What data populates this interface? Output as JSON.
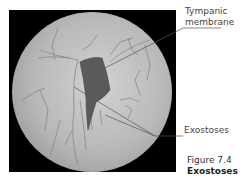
{
  "figure": {
    "labels": {
      "tympanic_line1": "Tympanic",
      "tympanic_line2": "membrane",
      "exostoses": "Exostoses"
    },
    "caption": {
      "number": "Figure 7.4",
      "title": "Exostoses"
    }
  },
  "colors": {
    "background_frame": "#000000",
    "canal_fill": "#b4b4b4",
    "membrane_fill": "#555555",
    "leader_line": "#555555"
  }
}
